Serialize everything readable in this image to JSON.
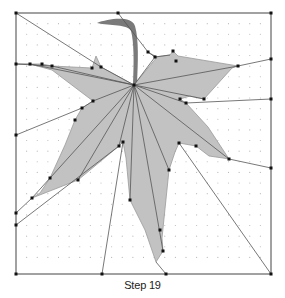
{
  "caption": "Step 19",
  "colors": {
    "background": "#ffffff",
    "leaf_fill": "#c2c2c2",
    "leaf_stroke": "#9a9a9a",
    "stem": "#7a7a7a",
    "line": "#555555",
    "vertex": "#111111",
    "grid_dot": "#b8b8b8",
    "border": "#444444"
  },
  "square": {
    "x": 16,
    "y": 13,
    "size": 255,
    "divisions": 24
  },
  "center": [
    134,
    85
  ],
  "leaf_outline": [
    [
      134,
      85
    ],
    [
      101,
      67
    ],
    [
      96,
      56
    ],
    [
      92,
      68
    ],
    [
      52,
      66
    ],
    [
      42,
      64
    ],
    [
      30,
      64
    ],
    [
      52,
      70
    ],
    [
      93,
      101
    ],
    [
      82,
      108
    ],
    [
      75,
      120
    ],
    [
      65,
      145
    ],
    [
      50,
      178
    ],
    [
      40,
      193
    ],
    [
      32,
      198
    ],
    [
      78,
      180
    ],
    [
      119,
      146
    ],
    [
      123,
      142
    ],
    [
      126,
      158
    ],
    [
      130,
      200
    ],
    [
      145,
      230
    ],
    [
      156,
      262
    ],
    [
      163,
      251
    ],
    [
      162,
      238
    ],
    [
      169,
      170
    ],
    [
      175,
      152
    ],
    [
      179,
      143
    ],
    [
      196,
      146
    ],
    [
      209,
      156
    ],
    [
      223,
      158
    ],
    [
      229,
      159
    ],
    [
      208,
      127
    ],
    [
      186,
      103
    ],
    [
      180,
      99
    ],
    [
      190,
      96
    ],
    [
      204,
      99
    ],
    [
      232,
      68
    ],
    [
      238,
      66
    ],
    [
      178,
      56
    ],
    [
      173,
      51
    ],
    [
      170,
      55
    ],
    [
      155,
      57
    ],
    [
      148,
      52
    ],
    [
      157,
      57
    ],
    [
      134,
      85
    ]
  ],
  "stem_path": "M97,23 C108,19 131,15 135,26 C139,40 138,62 137,84 L133,84 C134,62 134,42 131,31 C128,24 110,26 97,23 Z",
  "crease_lines": [
    [
      [
        134,
        85
      ],
      [
        52,
        66
      ]
    ],
    [
      [
        134,
        85
      ],
      [
        30,
        64
      ]
    ],
    [
      [
        134,
        85
      ],
      [
        93,
        101
      ]
    ],
    [
      [
        134,
        85
      ],
      [
        32,
        198
      ]
    ],
    [
      [
        134,
        85
      ],
      [
        78,
        180
      ]
    ],
    [
      [
        134,
        85
      ],
      [
        119,
        146
      ]
    ],
    [
      [
        134,
        85
      ],
      [
        130,
        200
      ]
    ],
    [
      [
        134,
        85
      ],
      [
        163,
        251
      ]
    ],
    [
      [
        134,
        85
      ],
      [
        169,
        170
      ]
    ],
    [
      [
        134,
        85
      ],
      [
        229,
        159
      ]
    ],
    [
      [
        134,
        85
      ],
      [
        204,
        99
      ]
    ],
    [
      [
        134,
        85
      ],
      [
        238,
        66
      ]
    ],
    [
      [
        134,
        85
      ],
      [
        186,
        103
      ]
    ],
    [
      [
        134,
        85
      ],
      [
        155,
        57
      ]
    ],
    [
      [
        134,
        85
      ],
      [
        101,
        67
      ]
    ]
  ],
  "outer_lines": [
    [
      [
        16,
        13
      ],
      [
        101,
        67
      ]
    ],
    [
      [
        16,
        64
      ],
      [
        52,
        66
      ]
    ],
    [
      [
        16,
        64
      ],
      [
        30,
        64
      ]
    ],
    [
      [
        16,
        135
      ],
      [
        82,
        108
      ]
    ],
    [
      [
        16,
        213
      ],
      [
        32,
        198
      ]
    ],
    [
      [
        16,
        225
      ],
      [
        119,
        146
      ]
    ],
    [
      [
        118,
        13
      ],
      [
        148,
        52
      ]
    ],
    [
      [
        271,
        59
      ],
      [
        238,
        66
      ]
    ],
    [
      [
        271,
        99
      ],
      [
        186,
        103
      ]
    ],
    [
      [
        271,
        168
      ],
      [
        229,
        159
      ]
    ],
    [
      [
        271,
        274
      ],
      [
        179,
        143
      ]
    ],
    [
      [
        102,
        274
      ],
      [
        123,
        142
      ]
    ],
    [
      [
        166,
        274
      ],
      [
        156,
        262
      ]
    ],
    [
      [
        148,
        52
      ],
      [
        155,
        57
      ]
    ],
    [
      [
        155,
        57
      ],
      [
        170,
        55
      ]
    ],
    [
      [
        82,
        108
      ],
      [
        93,
        101
      ]
    ]
  ],
  "vertices": [
    [
      16,
      13
    ],
    [
      118,
      13
    ],
    [
      271,
      13
    ],
    [
      16,
      64
    ],
    [
      271,
      59
    ],
    [
      271,
      99
    ],
    [
      16,
      135
    ],
    [
      271,
      168
    ],
    [
      16,
      213
    ],
    [
      16,
      225
    ],
    [
      16,
      274
    ],
    [
      102,
      274
    ],
    [
      166,
      274
    ],
    [
      271,
      274
    ],
    [
      134,
      85
    ],
    [
      101,
      67
    ],
    [
      52,
      66
    ],
    [
      30,
      64
    ],
    [
      42,
      64
    ],
    [
      92,
      68
    ],
    [
      93,
      101
    ],
    [
      82,
      108
    ],
    [
      75,
      120
    ],
    [
      50,
      178
    ],
    [
      32,
      198
    ],
    [
      78,
      180
    ],
    [
      119,
      146
    ],
    [
      123,
      142
    ],
    [
      130,
      200
    ],
    [
      163,
      251
    ],
    [
      160,
      230
    ],
    [
      169,
      170
    ],
    [
      179,
      143
    ],
    [
      196,
      146
    ],
    [
      229,
      159
    ],
    [
      186,
      103
    ],
    [
      180,
      99
    ],
    [
      204,
      99
    ],
    [
      238,
      66
    ],
    [
      155,
      57
    ],
    [
      148,
      52
    ],
    [
      173,
      51
    ],
    [
      176,
      61
    ]
  ]
}
